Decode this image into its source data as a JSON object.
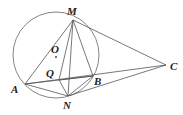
{
  "diagram": {
    "labels": {
      "M": "M",
      "O": "O",
      "Q": "Q",
      "A": "A",
      "B": "B",
      "N": "N",
      "C": "C"
    },
    "stroke_color": "#555555",
    "circle": {
      "cx": 56,
      "cy": 55,
      "r": 43
    },
    "points": {
      "M": [
        73,
        20
      ],
      "O": [
        56,
        57
      ],
      "Q": [
        59,
        80
      ],
      "A": [
        25,
        84
      ],
      "B": [
        93,
        76
      ],
      "N": [
        68,
        96
      ],
      "C": [
        166,
        65
      ]
    },
    "segments": [
      [
        "A",
        "M"
      ],
      [
        "M",
        "N"
      ],
      [
        "M",
        "Q"
      ],
      [
        "M",
        "B"
      ],
      [
        "M",
        "C"
      ],
      [
        "A",
        "C"
      ],
      [
        "A",
        "N"
      ],
      [
        "A",
        "B"
      ],
      [
        "Q",
        "N"
      ],
      [
        "Q",
        "B"
      ],
      [
        "N",
        "B"
      ],
      [
        "N",
        "C"
      ]
    ]
  }
}
